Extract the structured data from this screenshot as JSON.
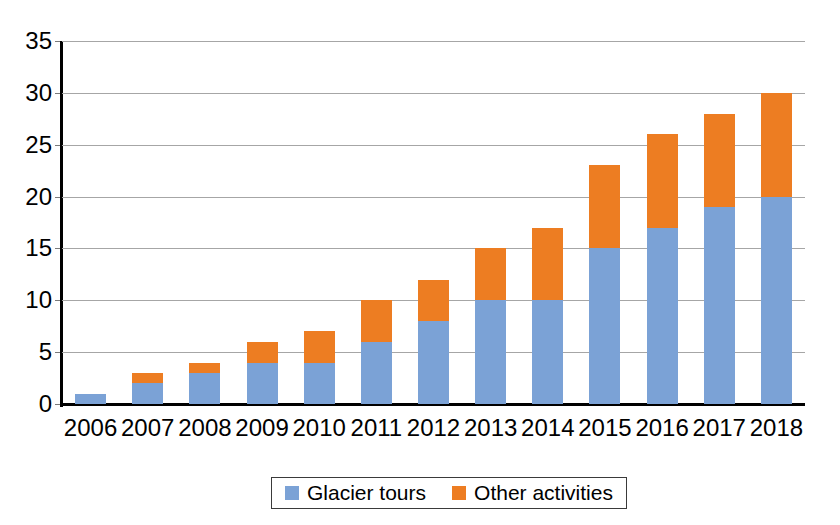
{
  "chart_data": {
    "type": "bar",
    "stacked": true,
    "title": "",
    "subtitle": "",
    "xlabel": "",
    "ylabel": "",
    "categories": [
      "2006",
      "2007",
      "2008",
      "2009",
      "2010",
      "2011",
      "2012",
      "2013",
      "2014",
      "2015",
      "2016",
      "2017",
      "2018"
    ],
    "series": [
      {
        "name": "Glacier tours",
        "color": "#7ba2d6",
        "values": [
          1,
          2,
          3,
          4,
          4,
          6,
          8,
          10,
          10,
          15,
          17,
          19,
          20
        ]
      },
      {
        "name": "Other activities",
        "color": "#ed7d22",
        "values": [
          0,
          1,
          1,
          2,
          3,
          4,
          4,
          5,
          7,
          8,
          9,
          9,
          10
        ]
      }
    ],
    "totals": [
      1,
      3,
      4,
      6,
      7,
      10,
      12,
      15,
      17,
      23,
      26,
      28,
      30
    ],
    "ylim": [
      0,
      35
    ],
    "yticks": [
      0,
      5,
      10,
      15,
      20,
      25,
      30,
      35
    ],
    "ytick_labels": [
      "0",
      "5",
      "10",
      "15",
      "20",
      "25",
      "30",
      "35"
    ],
    "grid": true,
    "grid_axis": "y",
    "legend_position": "bottom"
  },
  "legend": {
    "items": [
      {
        "label": "Glacier tours",
        "color": "#7ba2d6"
      },
      {
        "label": "Other activities",
        "color": "#ed7d22"
      }
    ]
  },
  "colors": {
    "glacier_tours": "#7ba2d6",
    "other_activities": "#ed7d22",
    "gridline": "#a6a6a6",
    "axis": "#000000",
    "background": "#ffffff"
  }
}
